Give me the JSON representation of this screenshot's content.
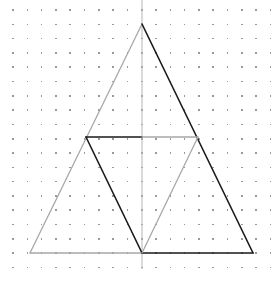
{
  "figure": {
    "canvas": {
      "width": 277,
      "height": 282,
      "background_color": "#ffffff"
    },
    "grid": {
      "type": "dot-lattice",
      "dot_color": "#9a9a9a",
      "dot_size_px": 1.6,
      "spacing_x": 14.3,
      "spacing_y": 14.3,
      "origin_x": 13,
      "origin_y": 10,
      "columns": 19,
      "rows": 20
    },
    "colors": {
      "dark_stroke": "#1a1a1a",
      "light_stroke": "#a8a8a8",
      "axis_stroke": "#b5b5b5",
      "dot": "#9a9a9a"
    },
    "axis": {
      "label": "vertical-axis",
      "x": 142,
      "y_top": 0,
      "y_bottom": 269,
      "color": "#b5b5b5",
      "width": 1
    },
    "points": {
      "apex": {
        "name": "apex",
        "x": 142,
        "y": 24
      },
      "base_left": {
        "name": "base-left",
        "x": 30,
        "y": 253
      },
      "base_right": {
        "name": "base-right",
        "x": 253,
        "y": 253
      },
      "base_mid": {
        "name": "base-midpoint",
        "x": 142,
        "y": 253
      },
      "mid_left": {
        "name": "left-side-midpoint",
        "x": 86,
        "y": 137
      },
      "mid_right": {
        "name": "right-side-midpoint",
        "x": 198,
        "y": 137
      }
    },
    "segments": [
      {
        "name": "outer-left-edge",
        "x1": 30,
        "y1": 253,
        "x2": 142,
        "y2": 24,
        "color": "#a8a8a8",
        "width": 1.3
      },
      {
        "name": "outer-right-edge",
        "x1": 142,
        "y1": 24,
        "x2": 253,
        "y2": 253,
        "color": "#1a1a1a",
        "width": 1.6
      },
      {
        "name": "base-left-half",
        "x1": 30,
        "y1": 253,
        "x2": 142,
        "y2": 253,
        "color": "#a8a8a8",
        "width": 1.3
      },
      {
        "name": "base-right-half",
        "x1": 142,
        "y1": 253,
        "x2": 253,
        "y2": 253,
        "color": "#1a1a1a",
        "width": 1.6
      },
      {
        "name": "midline-left-half",
        "x1": 86,
        "y1": 137,
        "x2": 142,
        "y2": 137,
        "color": "#1a1a1a",
        "width": 1.6
      },
      {
        "name": "midline-right-half",
        "x1": 142,
        "y1": 137,
        "x2": 198,
        "y2": 137,
        "color": "#a8a8a8",
        "width": 1.3
      },
      {
        "name": "inner-left-edge",
        "x1": 86,
        "y1": 137,
        "x2": 142,
        "y2": 253,
        "color": "#1a1a1a",
        "width": 1.6
      },
      {
        "name": "inner-right-edge",
        "x1": 142,
        "y1": 253,
        "x2": 198,
        "y2": 137,
        "color": "#a8a8a8",
        "width": 1.3
      }
    ],
    "shapes": [
      {
        "name": "outer-triangle",
        "vertices": "apex, base-left, base-right"
      },
      {
        "name": "medial-inverted-triangle",
        "vertices": "left-side-midpoint, right-side-midpoint, base-midpoint"
      },
      {
        "name": "left-lower-triangle",
        "vertices": "base-left, left-side-midpoint, base-midpoint"
      },
      {
        "name": "right-lower-triangle",
        "vertices": "base-midpoint, right-side-midpoint, base-right"
      },
      {
        "name": "upper-triangle",
        "vertices": "left-side-midpoint, apex, right-side-midpoint"
      }
    ]
  }
}
